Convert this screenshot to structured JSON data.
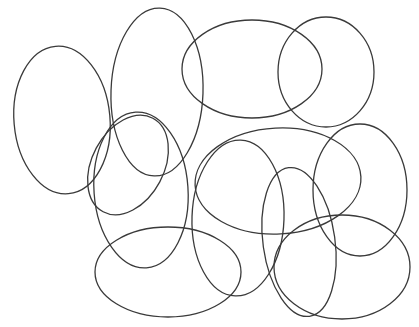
{
  "figure": {
    "name": "overlapping-ellipses",
    "width": 419,
    "height": 327,
    "background_color": "#ffffff",
    "stroke_color": "#3a3a3a",
    "stroke_width": 1.3,
    "fill": "none",
    "shape_count": 12
  },
  "chart_data": {
    "type": "scatter",
    "subtitle": "",
    "xlabel": "",
    "ylabel": "",
    "xlim": [
      0,
      419
    ],
    "ylim": [
      0,
      327
    ],
    "grid": false,
    "legend": false,
    "axes_visible": false,
    "tick_labels": [],
    "annotations": [],
    "shape_type": "ellipse",
    "stroke_color": "#3a3a3a",
    "stroke_width": 1.3,
    "fill": "none",
    "shapes": [
      {
        "id": "ellipse-1",
        "label": "left-tall-ellipse",
        "cx": 62,
        "cy": 120,
        "rx": 48,
        "ry": 74,
        "rotation": -5
      },
      {
        "id": "ellipse-2",
        "label": "upper-left-tall-ellipse",
        "cx": 157,
        "cy": 92,
        "rx": 46,
        "ry": 84,
        "rotation": 2
      },
      {
        "id": "ellipse-3",
        "label": "top-wide-ellipse",
        "cx": 252,
        "cy": 69,
        "rx": 70,
        "ry": 49,
        "rotation": 0
      },
      {
        "id": "ellipse-4",
        "label": "top-right-tall-ellipse",
        "cx": 326,
        "cy": 72,
        "rx": 48,
        "ry": 55,
        "rotation": 0
      },
      {
        "id": "ellipse-5",
        "label": "mid-left-tilted-ellipse",
        "cx": 128,
        "cy": 165,
        "rx": 36,
        "ry": 53,
        "rotation": 28
      },
      {
        "id": "ellipse-6",
        "label": "left-lower-tall-ellipse",
        "cx": 141,
        "cy": 190,
        "rx": 47,
        "ry": 78,
        "rotation": -4
      },
      {
        "id": "ellipse-7",
        "label": "center-wide-ellipse",
        "cx": 278,
        "cy": 181,
        "rx": 83,
        "ry": 53,
        "rotation": -3
      },
      {
        "id": "ellipse-8",
        "label": "center-tall-ellipse",
        "cx": 238,
        "cy": 218,
        "rx": 46,
        "ry": 78,
        "rotation": 2
      },
      {
        "id": "ellipse-9",
        "label": "right-tall-ellipse",
        "cx": 360,
        "cy": 190,
        "rx": 47,
        "ry": 66,
        "rotation": 0
      },
      {
        "id": "ellipse-10",
        "label": "bottom-left-wide-ellipse",
        "cx": 168,
        "cy": 272,
        "rx": 73,
        "ry": 45,
        "rotation": 0
      },
      {
        "id": "ellipse-11",
        "label": "bottom-right-large-ellipse",
        "cx": 342,
        "cy": 267,
        "rx": 68,
        "ry": 52,
        "rotation": 0
      },
      {
        "id": "ellipse-12",
        "label": "bottom-center-tall-ellipse",
        "cx": 299,
        "cy": 242,
        "rx": 36,
        "ry": 75,
        "rotation": -8
      }
    ]
  }
}
